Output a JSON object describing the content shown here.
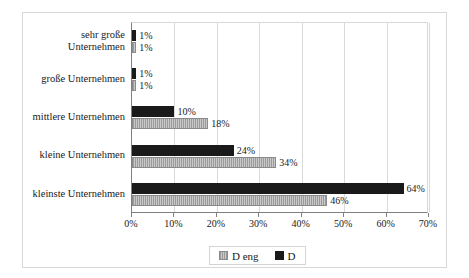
{
  "chart_data": {
    "type": "bar",
    "orientation": "horizontal",
    "title": "",
    "xlabel": "",
    "ylabel": "",
    "xlim": [
      0,
      70
    ],
    "grid": true,
    "legend_position": "bottom",
    "categories": [
      "sehr große Unternehmen",
      "große Unternehmen",
      "mittlere Unternehmen",
      "kleine Unternehmen",
      "kleinste Unternehmen"
    ],
    "category_lines": [
      [
        "sehr große",
        "Unternehmen"
      ],
      [
        "große Unternehmen"
      ],
      [
        "mittlere Unternehmen"
      ],
      [
        "kleine Unternehmen"
      ],
      [
        "kleinste Unternehmen"
      ]
    ],
    "series": [
      {
        "name": "D eng",
        "color": "#9a9a9a",
        "pattern": "vertical-stripes",
        "values": [
          1,
          1,
          18,
          34,
          46
        ],
        "labels": [
          "1%",
          "1%",
          "18%",
          "34%",
          "46%"
        ]
      },
      {
        "name": "D",
        "color": "#1a1a1a",
        "pattern": "solid",
        "values": [
          1,
          1,
          10,
          24,
          64
        ],
        "labels": [
          "1%",
          "1%",
          "10%",
          "24%",
          "64%"
        ]
      }
    ],
    "xticks": [
      0,
      10,
      20,
      30,
      40,
      50,
      60,
      70
    ],
    "xtick_labels": [
      "0%",
      "10%",
      "20%",
      "30%",
      "40%",
      "50%",
      "60%",
      "70%"
    ]
  },
  "legend": {
    "entries": [
      {
        "label": "D eng"
      },
      {
        "label": "D"
      }
    ]
  }
}
